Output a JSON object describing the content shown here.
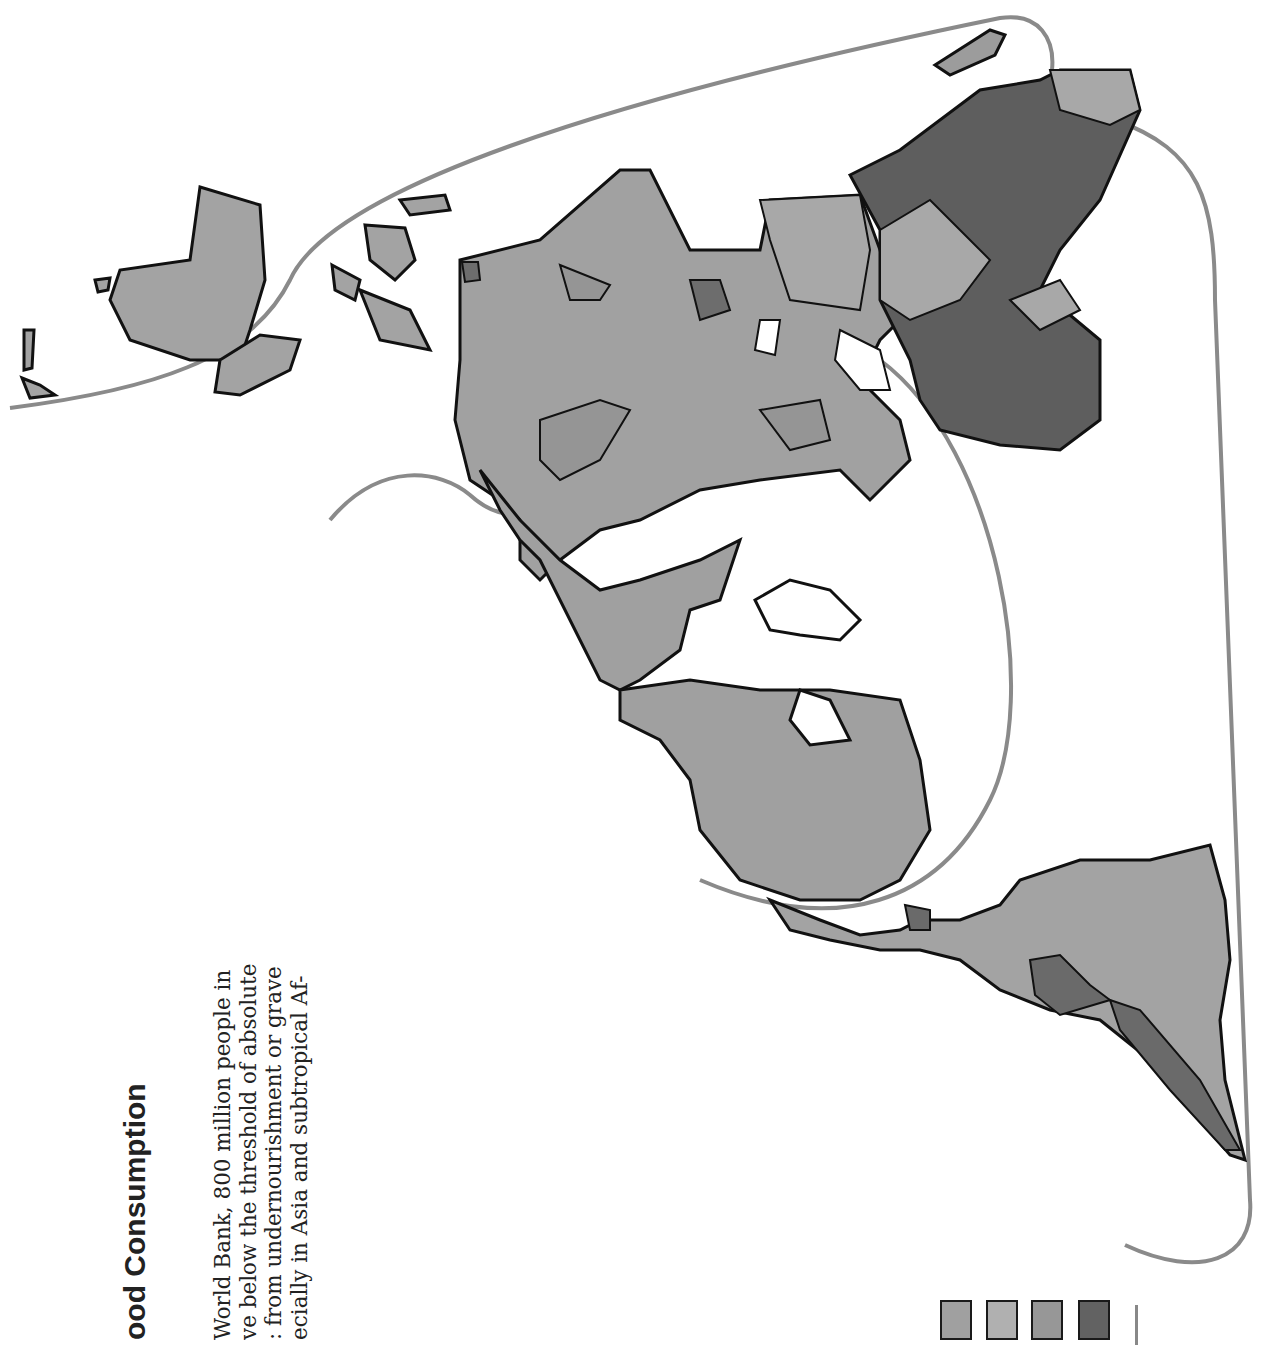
{
  "page": {
    "title": "ood Consumption",
    "body_lines": [
      "World Bank, 800 million people in",
      "ve below the threshold of absolute",
      ": from undernourishment or grave",
      "ecially in Asia and subtropical Af-"
    ]
  },
  "map": {
    "type": "choropleth",
    "orientation": "rotated 90°",
    "colors": {
      "land_light": "#a8a8a8",
      "land_medium": "#9a9a9a",
      "land_dark": "#6e6e6e",
      "land_darkest": "#5a5a5a",
      "outline": "#111111",
      "guide_curve": "#8a8a8a",
      "ice": "#ffffff"
    }
  },
  "legend": {
    "swatches": [
      {
        "color": "#a0a0a0"
      },
      {
        "color": "#b0b0b0"
      },
      {
        "color": "#979797"
      },
      {
        "color": "#626262"
      }
    ]
  }
}
